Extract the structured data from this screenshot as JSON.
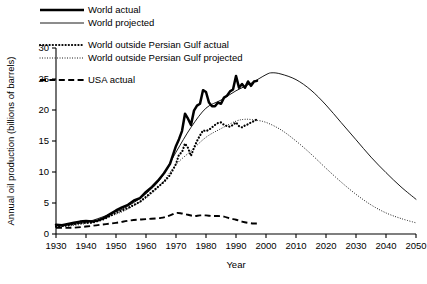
{
  "chart_data": {
    "type": "line",
    "title": "",
    "xlabel": "Year",
    "ylabel": "Annual oil production (billions of barrels)",
    "xlim": [
      1930,
      2050
    ],
    "ylim": [
      0,
      30
    ],
    "xticks": [
      1930,
      1940,
      1950,
      1960,
      1970,
      1980,
      1990,
      2000,
      2010,
      2020,
      2030,
      2040,
      2050
    ],
    "yticks": [
      0,
      5,
      10,
      15,
      20,
      25,
      30
    ],
    "xtick_labels": [
      "1930",
      "1940",
      "1950",
      "1960",
      "1970",
      "1980",
      "1990",
      "2000",
      "2010",
      "2020",
      "2030",
      "2040",
      "2050"
    ],
    "ytick_labels": [
      "0",
      "5",
      "10",
      "15",
      "20",
      "25",
      "30"
    ],
    "grid": false,
    "legend_position": "top-left-outside",
    "series": [
      {
        "name": "World actual",
        "style": "thick-solid",
        "color": "#000000",
        "x": [
          1930,
          1932,
          1934,
          1936,
          1938,
          1940,
          1942,
          1944,
          1946,
          1948,
          1950,
          1952,
          1954,
          1956,
          1958,
          1960,
          1962,
          1964,
          1966,
          1968,
          1970,
          1971,
          1972,
          1973,
          1974,
          1975,
          1976,
          1977,
          1978,
          1979,
          1980,
          1981,
          1982,
          1983,
          1984,
          1985,
          1986,
          1987,
          1988,
          1989,
          1990,
          1991,
          1992,
          1993,
          1994,
          1995,
          1996,
          1997
        ],
        "values": [
          1.5,
          1.4,
          1.6,
          1.8,
          2.0,
          2.1,
          2.0,
          2.2,
          2.6,
          3.2,
          3.8,
          4.3,
          4.7,
          5.4,
          5.8,
          6.8,
          7.6,
          8.6,
          9.8,
          11.3,
          14.2,
          15.3,
          16.6,
          19.4,
          18.6,
          17.6,
          19.9,
          20.7,
          21.0,
          23.2,
          22.9,
          21.2,
          20.6,
          20.6,
          21.2,
          21.0,
          22.0,
          22.3,
          23.0,
          23.3,
          25.5,
          23.6,
          24.2,
          23.6,
          24.6,
          23.9,
          24.6,
          24.7
        ]
      },
      {
        "name": "World projected",
        "style": "thin-solid",
        "color": "#000000",
        "x": [
          1930,
          1940,
          1950,
          1955,
          1960,
          1965,
          1970,
          1975,
          1980,
          1985,
          1990,
          1995,
          2000,
          2002,
          2005,
          2010,
          2015,
          2020,
          2025,
          2030,
          2035,
          2040,
          2045,
          2050
        ],
        "values": [
          1.3,
          1.9,
          3.6,
          4.8,
          6.5,
          9.0,
          13.2,
          17.2,
          20.3,
          21.6,
          23.1,
          24.3,
          25.7,
          26.0,
          25.8,
          24.9,
          23.2,
          20.8,
          18.0,
          15.2,
          12.4,
          9.9,
          7.6,
          5.6
        ]
      },
      {
        "name": "World outside Persian Gulf actual",
        "style": "bold-dotted",
        "color": "#000000",
        "x": [
          1930,
          1934,
          1938,
          1942,
          1946,
          1950,
          1954,
          1958,
          1962,
          1966,
          1968,
          1970,
          1971,
          1972,
          1973,
          1974,
          1975,
          1976,
          1977,
          1978,
          1979,
          1980,
          1981,
          1982,
          1983,
          1984,
          1985,
          1986,
          1987,
          1988,
          1989,
          1990,
          1991,
          1992,
          1993,
          1994,
          1995,
          1996,
          1997
        ],
        "values": [
          1.2,
          1.4,
          1.8,
          1.8,
          2.4,
          3.4,
          4.2,
          5.2,
          6.8,
          8.4,
          9.5,
          11.3,
          12.8,
          13.2,
          14.6,
          13.9,
          12.6,
          13.9,
          15.0,
          15.9,
          16.7,
          16.6,
          16.8,
          17.2,
          17.6,
          17.9,
          18.0,
          17.6,
          17.4,
          17.3,
          17.6,
          18.0,
          17.4,
          17.2,
          17.5,
          17.7,
          18.0,
          18.2,
          18.5
        ]
      },
      {
        "name": "World outside Persian Gulf projected",
        "style": "fine-dotted",
        "color": "#000000",
        "x": [
          1930,
          1940,
          1950,
          1955,
          1960,
          1965,
          1970,
          1975,
          1980,
          1985,
          1990,
          1993,
          1996,
          2000,
          2005,
          2010,
          2015,
          2020,
          2025,
          2030,
          2035,
          2040,
          2045,
          2050
        ],
        "values": [
          1.1,
          1.7,
          3.2,
          4.3,
          5.8,
          8.0,
          11.2,
          13.4,
          15.6,
          17.0,
          18.2,
          18.5,
          18.4,
          18.0,
          16.8,
          15.0,
          12.9,
          10.6,
          8.4,
          6.4,
          4.7,
          3.4,
          2.5,
          1.8
        ]
      },
      {
        "name": "USA actual",
        "style": "dashed",
        "color": "#000000",
        "x": [
          1930,
          1935,
          1940,
          1945,
          1950,
          1955,
          1960,
          1965,
          1968,
          1970,
          1972,
          1974,
          1976,
          1978,
          1980,
          1982,
          1984,
          1986,
          1988,
          1990,
          1992,
          1994,
          1996,
          1997
        ],
        "values": [
          1.0,
          1.0,
          1.2,
          1.5,
          1.8,
          2.2,
          2.4,
          2.6,
          3.0,
          3.4,
          3.3,
          3.1,
          2.9,
          3.0,
          3.0,
          2.9,
          2.9,
          2.8,
          2.5,
          2.3,
          2.0,
          1.8,
          1.7,
          1.7
        ]
      }
    ]
  },
  "legend": {
    "items": [
      {
        "label": "World actual",
        "style": "thick-solid"
      },
      {
        "label": "World projected",
        "style": "thin-solid"
      },
      {
        "label": "World outside Persian Gulf actual",
        "style": "bold-dotted"
      },
      {
        "label": "World outside Persian Gulf projected",
        "style": "fine-dotted"
      },
      {
        "label": "USA actual",
        "style": "dashed"
      }
    ]
  },
  "axes": {
    "y_title": "Annual oil production (billions of barrels)",
    "x_title": "Year"
  },
  "colors": {
    "foreground": "#000000",
    "background": "#ffffff"
  }
}
